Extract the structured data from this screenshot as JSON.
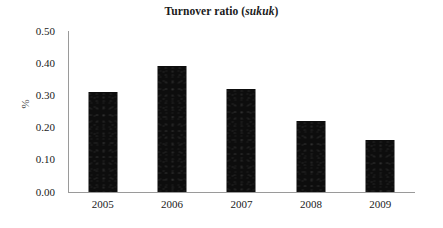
{
  "chart_data": {
    "type": "bar",
    "title": "Turnover ratio (sukuk)",
    "title_plain": "Turnover ratio (",
    "title_italic": "sukuk",
    "title_tail": ")",
    "categories": [
      "2005",
      "2006",
      "2007",
      "2008",
      "2009"
    ],
    "values": [
      0.31,
      0.39,
      0.32,
      0.22,
      0.16
    ],
    "xlabel": "",
    "ylabel": "%",
    "ylim": [
      0.0,
      0.5
    ],
    "ytick_values": [
      0.5,
      0.4,
      0.3,
      0.2,
      0.1,
      0.0
    ],
    "ytick_labels": [
      "0.50",
      "0.40",
      "0.30",
      "0.20",
      "0.10",
      "0.00"
    ],
    "grid": false,
    "legend": false,
    "legend_position": "none",
    "bar_color": "#0d0d0d",
    "axis_color": "#9a9a9a",
    "text_color": "#1a1a1a"
  }
}
